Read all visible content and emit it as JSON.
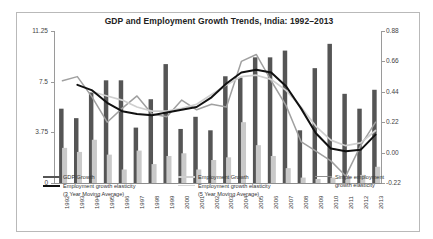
{
  "chart_data": {
    "type": "bar",
    "title": "GDP and Employment Growth Trends, India: 1992–2013",
    "xlabel": "",
    "ylabel": "",
    "grid": false,
    "legend_position": "bottom",
    "categories": [
      "1992",
      "1993",
      "1994",
      "1995",
      "1996",
      "1997",
      "1998",
      "1999",
      "2000",
      "2001",
      "2002",
      "2003",
      "2004",
      "2005",
      "2006",
      "2007",
      "2008",
      "2009",
      "2010",
      "2011",
      "2012",
      "2013"
    ],
    "left_axis": {
      "ticks": [
        "0",
        "3.75",
        "7.5",
        "11.25"
      ],
      "values": [
        0,
        3.75,
        7.5,
        11.25
      ],
      "ylim": [
        0,
        11.25
      ]
    },
    "right_axis": {
      "ticks": [
        "-0.22",
        "0.00",
        "0.22",
        "0.44",
        "0.66",
        "0.88"
      ],
      "values": [
        -0.22,
        0.0,
        0.22,
        0.44,
        0.66,
        0.88
      ],
      "ylim": [
        -0.22,
        0.88
      ]
    },
    "series": [
      {
        "name": "GDP Growth",
        "type": "bar",
        "axis": "left",
        "color": "#555555",
        "values": [
          5.5,
          4.8,
          6.7,
          7.6,
          7.6,
          4.1,
          6.2,
          8.8,
          4.0,
          4.9,
          3.9,
          7.9,
          7.8,
          9.3,
          9.3,
          9.8,
          3.9,
          8.5,
          10.3,
          6.6,
          5.5,
          6.9
        ]
      },
      {
        "name": "Employment Growth",
        "type": "bar",
        "axis": "left",
        "color": "#c9c9c9",
        "values": [
          2.6,
          2.3,
          3.2,
          2.1,
          1.0,
          2.4,
          1.4,
          2.0,
          2.2,
          1.0,
          1.7,
          1.9,
          4.5,
          2.8,
          2.0,
          1.1,
          0.4,
          0.3,
          0.4,
          0.5,
          0.6,
          1.2
        ]
      },
      {
        "name": "Employment growth elasticity (3 Year Moving Average)",
        "type": "line",
        "axis": "right",
        "color": "#111111",
        "values": [
          null,
          0.49,
          0.45,
          0.36,
          0.3,
          0.28,
          0.27,
          0.29,
          0.31,
          0.33,
          0.4,
          0.5,
          0.58,
          0.6,
          0.58,
          0.48,
          0.32,
          0.14,
          0.03,
          0.01,
          0.02,
          0.13
        ]
      },
      {
        "name": "Employment growth elasticity (5 Year Moving Average)",
        "type": "line",
        "axis": "right",
        "color": "#cfcfcf",
        "values": [
          null,
          null,
          0.44,
          0.41,
          0.38,
          0.33,
          0.3,
          0.3,
          0.32,
          0.35,
          0.42,
          0.49,
          0.55,
          0.56,
          0.53,
          0.45,
          0.33,
          0.19,
          0.09,
          0.05,
          0.07,
          0.16
        ]
      },
      {
        "name": "Simple employment growth elasticity",
        "type": "line",
        "axis": "right",
        "color": "#a0a0a0",
        "values": [
          0.52,
          0.55,
          0.4,
          0.22,
          0.32,
          0.41,
          0.28,
          0.26,
          0.38,
          0.31,
          0.35,
          0.33,
          0.66,
          0.71,
          0.52,
          0.34,
          0.08,
          0.01,
          -0.06,
          -0.17,
          0.05,
          0.22
        ]
      }
    ]
  },
  "legend": {
    "items": [
      {
        "label_line1": "GDP Growth",
        "label_line2": "",
        "color": "#555555",
        "weight": "2.2"
      },
      {
        "label_line1": "Employment growth elasticity",
        "label_line2": "(3 Year Moving Average)",
        "color": "#111111",
        "weight": "2.4"
      },
      {
        "label_line1": "Employment Growth",
        "label_line2": "",
        "color": "#cfcfcf",
        "weight": "2.2"
      },
      {
        "label_line1": "Employment growth elasticity",
        "label_line2": "(5 Year Moving Average)",
        "color": "#d4d4d4",
        "weight": "1.6"
      },
      {
        "label_line1": "Simple employment",
        "label_line2": "growth elasticity",
        "color": "#8f8f8f",
        "weight": "1.4"
      }
    ]
  }
}
